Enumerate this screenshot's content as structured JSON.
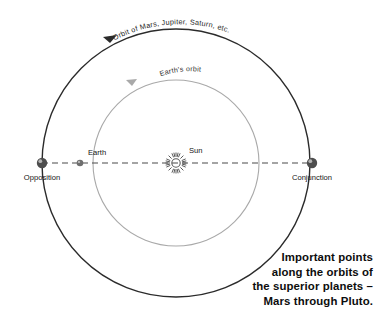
{
  "diagram": {
    "title": "Important points along the orbits of the superior planets",
    "labels": {
      "outer_orbit": "Orbit of Mars, Jupiter, Saturn, etc.",
      "inner_orbit": "Earth's orbit",
      "sun": "Sun",
      "earth": "Earth",
      "opposition": "Opposition",
      "conjunction": "Conjunction"
    },
    "caption": {
      "line1": "Important points",
      "line2": "along the orbits of",
      "line3": "the superior planets –",
      "line4": "Mars through Pluto."
    },
    "colors": {
      "outer_orbit_stroke": "#2b2b2b",
      "inner_orbit_stroke": "#a9a9a9",
      "axis_stroke": "#4a4a4a",
      "planet_fill": "#4d4d4d",
      "earth_fill": "#6e6e6e",
      "sun_stroke": "#5a5a5a",
      "text": "#141414",
      "background": "#ffffff"
    },
    "geometry": {
      "center_x": 176,
      "center_y": 163,
      "outer_radius": 134,
      "inner_radius": 83,
      "opposition_x": 42,
      "earth_x": 80,
      "conjunction_x": 312,
      "outer_orbit_direction": "counterclockwise",
      "inner_orbit_direction": "counterclockwise"
    }
  }
}
